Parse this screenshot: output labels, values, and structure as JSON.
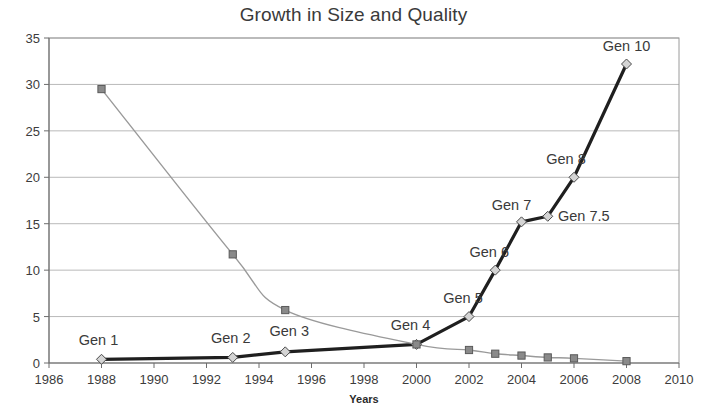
{
  "chart_data": {
    "type": "line",
    "title": "Growth in Size and Quality",
    "xlabel": "Years",
    "ylabel": "",
    "xlim": [
      1986,
      2010
    ],
    "ylim": [
      0,
      35
    ],
    "xticks": [
      1986,
      1988,
      1990,
      1992,
      1994,
      1996,
      1998,
      2000,
      2002,
      2004,
      2006,
      2008,
      2010
    ],
    "yticks": [
      0,
      5,
      10,
      15,
      20,
      25,
      30,
      35
    ],
    "grid": "horizontal",
    "legend": "none",
    "series": [
      {
        "name": "Size",
        "color": "#1f1f1f",
        "marker": "diamond",
        "marker_fill": "#d4d4d4",
        "x": [
          1988,
          1993,
          1995,
          2000,
          2002,
          2003,
          2004,
          2005,
          2006,
          2008
        ],
        "values": [
          0.4,
          0.6,
          1.2,
          2.0,
          5.0,
          10.0,
          15.2,
          15.8,
          20.0,
          32.2
        ],
        "point_labels": [
          "Gen 1",
          "Gen 2",
          "Gen 3",
          "Gen 4",
          "Gen 5",
          "Gen 6",
          "Gen 7",
          "Gen 7.5",
          "Gen 8",
          "Gen 10"
        ]
      },
      {
        "name": "Quality",
        "color": "#9a9a9a",
        "marker": "square",
        "marker_fill": "#8a8a8a",
        "x": [
          1988,
          1993,
          1995,
          2000,
          2002,
          2003,
          2004,
          2005,
          2006,
          2008
        ],
        "values": [
          29.5,
          11.7,
          5.7,
          2.0,
          1.4,
          1.0,
          0.8,
          0.6,
          0.5,
          0.2
        ],
        "point_labels": []
      }
    ],
    "annotations": [
      {
        "text": "Gen 1",
        "x": 1988,
        "y": 0.4
      },
      {
        "text": "Gen 2",
        "x": 1993,
        "y": 0.6
      },
      {
        "text": "Gen 3",
        "x": 1995,
        "y": 1.2
      },
      {
        "text": "Gen 4",
        "x": 2000,
        "y": 2.0
      },
      {
        "text": "Gen 5",
        "x": 2002,
        "y": 5.0
      },
      {
        "text": "Gen 6",
        "x": 2003,
        "y": 10.0
      },
      {
        "text": "Gen 7",
        "x": 2004,
        "y": 15.2
      },
      {
        "text": "Gen 7.5",
        "x": 2005,
        "y": 15.8
      },
      {
        "text": "Gen 8",
        "x": 2006,
        "y": 20.0
      },
      {
        "text": "Gen 10",
        "x": 2008,
        "y": 32.2
      }
    ]
  },
  "labels": {
    "annotation_offsets": [
      {
        "dx": -3,
        "dy": -14,
        "anchor": "middle"
      },
      {
        "dx": -2,
        "dy": -14,
        "anchor": "middle"
      },
      {
        "dx": 4,
        "dy": -16,
        "anchor": "middle"
      },
      {
        "dx": -6,
        "dy": -14,
        "anchor": "middle"
      },
      {
        "dx": -6,
        "dy": -14,
        "anchor": "middle"
      },
      {
        "dx": -6,
        "dy": -13,
        "anchor": "middle"
      },
      {
        "dx": -10,
        "dy": -12,
        "anchor": "middle"
      },
      {
        "dx": 36,
        "dy": 5,
        "anchor": "middle"
      },
      {
        "dx": -8,
        "dy": -13,
        "anchor": "middle"
      },
      {
        "dx": 0,
        "dy": -13,
        "anchor": "middle"
      }
    ]
  }
}
